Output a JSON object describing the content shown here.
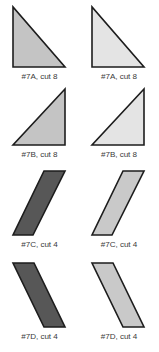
{
  "document": {
    "title": "Pattern Piece Cutting Diagram",
    "background_color": "#ffffff",
    "width": 159,
    "height": 352
  },
  "palette": {
    "dark_fabric": "#575757",
    "medium_fabric": "#c4c4c4",
    "light_fabric": "#c9c9c9",
    "pale_fabric": "#e4e4e4",
    "outline": "#1d1d1d",
    "label_text": "#3a3a3a"
  },
  "pieces": [
    {
      "id": "7A-dark",
      "code": "#7A",
      "cut_count": 8,
      "label": "#7A, cut 8",
      "shape": "right-triangle",
      "orientation": "vertical-left-edge",
      "fill": "#c4c4c4",
      "stroke": "#1d1d1d",
      "column": "left",
      "row": "A",
      "points": "1,1 1,61 53,61"
    },
    {
      "id": "7A-light",
      "code": "#7A",
      "cut_count": 8,
      "label": "#7A, cut 8",
      "shape": "right-triangle",
      "orientation": "vertical-left-edge",
      "fill": "#e4e4e4",
      "stroke": "#1d1d1d",
      "column": "right",
      "row": "A",
      "points": "1,1 1,61 53,61"
    },
    {
      "id": "7B-dark",
      "code": "#7B",
      "cut_count": 8,
      "label": "#7B, cut 8",
      "shape": "right-triangle",
      "orientation": "vertical-right-edge",
      "fill": "#c4c4c4",
      "stroke": "#1d1d1d",
      "column": "left",
      "row": "B",
      "points": "53,1 53,57 1,57"
    },
    {
      "id": "7B-light",
      "code": "#7B",
      "cut_count": 8,
      "label": "#7B, cut 8",
      "shape": "right-triangle",
      "orientation": "vertical-right-edge",
      "fill": "#e4e4e4",
      "stroke": "#1d1d1d",
      "column": "right",
      "row": "B",
      "points": "53,1 53,57 1,57"
    },
    {
      "id": "7C-dark",
      "code": "#7C",
      "cut_count": 4,
      "label": "#7C, cut 4",
      "shape": "parallelogram",
      "orientation": "leans-right",
      "fill": "#575757",
      "stroke": "#1d1d1d",
      "column": "left",
      "row": "C",
      "points": "32,1 53,1 21,65 1,65"
    },
    {
      "id": "7C-light",
      "code": "#7C",
      "cut_count": 4,
      "label": "#7C, cut 4",
      "shape": "parallelogram",
      "orientation": "leans-right",
      "fill": "#c9c9c9",
      "stroke": "#1d1d1d",
      "column": "right",
      "row": "C",
      "points": "32,1 53,1 21,65 1,65"
    },
    {
      "id": "7D-dark",
      "code": "#7D",
      "cut_count": 4,
      "label": "#7D, cut 4",
      "shape": "parallelogram",
      "orientation": "leans-left",
      "fill": "#575757",
      "stroke": "#1d1d1d",
      "column": "left",
      "row": "D",
      "points": "1,1 22,1 53,65 32,65"
    },
    {
      "id": "7D-light",
      "code": "#7D",
      "cut_count": 4,
      "label": "#7D, cut 4",
      "shape": "parallelogram",
      "orientation": "leans-left",
      "fill": "#c9c9c9",
      "stroke": "#1d1d1d",
      "column": "right",
      "row": "D",
      "points": "1,1 22,1 53,65 32,65"
    }
  ]
}
